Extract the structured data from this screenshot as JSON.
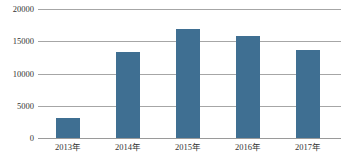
{
  "chart_data": {
    "type": "bar",
    "title": "",
    "subtitle": "",
    "xlabel": "",
    "ylabel": "",
    "categories": [
      "2013年",
      "2014年",
      "2015年",
      "2016年",
      "2017年"
    ],
    "values": [
      3100,
      13400,
      16900,
      15800,
      13700
    ],
    "ylim": [
      0,
      20000
    ],
    "ytick_labels": [
      "0",
      "5000",
      "10000",
      "15000",
      "20000"
    ],
    "ytick_values": [
      0,
      5000,
      10000,
      15000,
      20000
    ],
    "grid": true,
    "grid_axis": "y",
    "legend": false,
    "legend_position": "none",
    "series": [
      {
        "name": "",
        "color": "#3f6f92",
        "values": [
          3100,
          13400,
          16900,
          15800,
          13700
        ]
      }
    ],
    "annotations": [],
    "colors": {
      "bar": "#3f6f92",
      "gridline": "#a6a6a6",
      "axis": "#9a9a9a",
      "background": "#ffffff",
      "tick_text": "#333333"
    }
  }
}
